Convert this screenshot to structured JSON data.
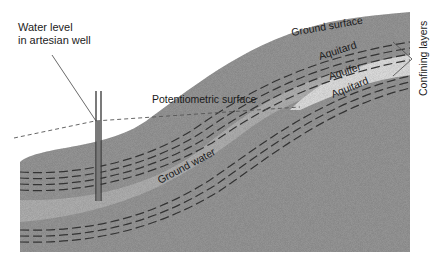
{
  "diagram": {
    "type": "geologic cross-section",
    "labels": {
      "well_water_level": [
        "Water level",
        "in artesian well"
      ],
      "potentiometric_surface": "Potentiometric surface",
      "ground_surface": "Ground surface",
      "aquitard_upper": "Aquitard",
      "aquifer": "Aquifer",
      "aquitard_lower": "Aquitard",
      "ground_water": "Ground water",
      "confining_layers": "Confining layers"
    },
    "colors": {
      "ground": "#9a9a9a",
      "aquifer": "#e2e2e2",
      "aquitard_dash": "#3a3a3a",
      "line": "#444444",
      "background": "#ffffff"
    }
  }
}
